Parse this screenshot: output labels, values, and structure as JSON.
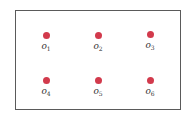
{
  "diagram": {
    "frame_color": "#5a5a5a",
    "dot_color": "#d23a4c",
    "nodes": [
      {
        "symbol": "o",
        "index": "1",
        "row": 1,
        "col": 1
      },
      {
        "symbol": "o",
        "index": "2",
        "row": 1,
        "col": 2
      },
      {
        "symbol": "o",
        "index": "3",
        "row": 1,
        "col": 3
      },
      {
        "symbol": "o",
        "index": "4",
        "row": 2,
        "col": 1
      },
      {
        "symbol": "o",
        "index": "5",
        "row": 2,
        "col": 2
      },
      {
        "symbol": "o",
        "index": "6",
        "row": 2,
        "col": 3
      }
    ]
  }
}
